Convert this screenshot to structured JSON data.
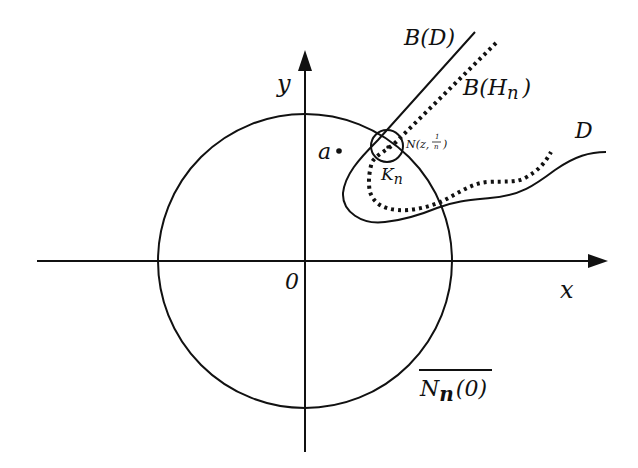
{
  "diagram": {
    "type": "complex-analysis-region-diagram",
    "colors": {
      "ink": "#111111",
      "background": "#ffffff"
    },
    "axes": {
      "x_label": "x",
      "y_label": "y",
      "origin_label": "0"
    },
    "labels": {
      "point_a": "a",
      "boundary_D": "B(D)",
      "boundary_H_main": "B(H",
      "boundary_H_sub": "n",
      "boundary_H_close": ")",
      "region_D": "D",
      "neighborhood_N": "N(z,",
      "neighborhood_frac_num": "1",
      "neighborhood_frac_den": "n",
      "neighborhood_close": ")",
      "K_main": "K",
      "K_sub": "n",
      "closure_N_main": "N",
      "closure_N_sub": "n",
      "closure_N_arg": "(0)"
    },
    "elements": [
      {
        "name": "x-axis",
        "style": "solid arrow"
      },
      {
        "name": "y-axis",
        "style": "solid arrow"
      },
      {
        "name": "closed-disk-Nn0",
        "style": "solid circle centered at origin"
      },
      {
        "name": "boundary-D",
        "style": "solid curve"
      },
      {
        "name": "boundary-Hn",
        "style": "dotted curve"
      },
      {
        "name": "neighborhood-circle",
        "style": "small solid circle"
      },
      {
        "name": "point-a",
        "style": "dot"
      }
    ]
  }
}
